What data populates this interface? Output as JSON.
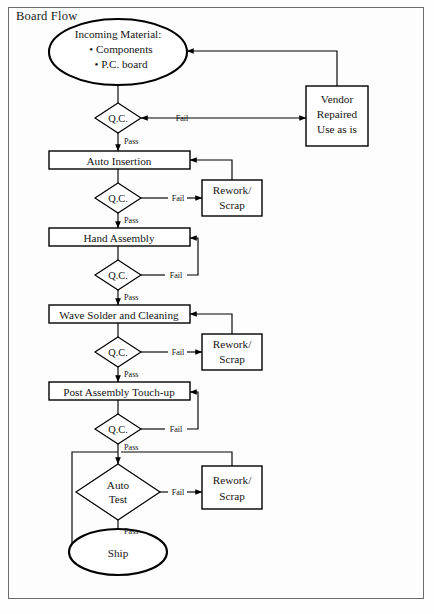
{
  "diagram": {
    "title": "Board Flow",
    "type": "flowchart",
    "nodes": [
      {
        "id": "incoming",
        "shape": "ellipse",
        "lines": [
          "Incoming Material:",
          "• Components",
          "• P.C. board"
        ]
      },
      {
        "id": "qc1",
        "shape": "diamond",
        "lines": [
          "Q.C."
        ]
      },
      {
        "id": "vendor",
        "shape": "box",
        "lines": [
          "Vendor",
          "Repaired",
          "Use as is"
        ]
      },
      {
        "id": "auto-insertion",
        "shape": "box",
        "lines": [
          "Auto Insertion"
        ]
      },
      {
        "id": "qc2",
        "shape": "diamond",
        "lines": [
          "Q.C."
        ]
      },
      {
        "id": "rework1",
        "shape": "box",
        "lines": [
          "Rework/",
          "Scrap"
        ]
      },
      {
        "id": "hand-assembly",
        "shape": "box",
        "lines": [
          "Hand Assembly"
        ]
      },
      {
        "id": "qc3",
        "shape": "diamond",
        "lines": [
          "Q.C."
        ]
      },
      {
        "id": "wave-solder",
        "shape": "box",
        "lines": [
          "Wave Solder and Cleaning"
        ]
      },
      {
        "id": "qc4",
        "shape": "diamond",
        "lines": [
          "Q.C."
        ]
      },
      {
        "id": "rework2",
        "shape": "box",
        "lines": [
          "Rework/",
          "Scrap"
        ]
      },
      {
        "id": "post-assembly",
        "shape": "box",
        "lines": [
          "Post Assembly Touch-up"
        ]
      },
      {
        "id": "qc5",
        "shape": "diamond",
        "lines": [
          "Q.C."
        ]
      },
      {
        "id": "auto-test",
        "shape": "diamond",
        "lines": [
          "Auto",
          "Test"
        ]
      },
      {
        "id": "rework3",
        "shape": "box",
        "lines": [
          "Rework/",
          "Scrap"
        ]
      },
      {
        "id": "ship",
        "shape": "ellipse",
        "lines": [
          "Ship"
        ]
      }
    ],
    "edge_labels": {
      "pass": "Pass",
      "fail": "Fail"
    },
    "edges": [
      {
        "from": "incoming",
        "to": "qc1",
        "label": ""
      },
      {
        "from": "qc1",
        "to": "vendor",
        "label": "Fail"
      },
      {
        "from": "vendor",
        "to": "incoming",
        "label": ""
      },
      {
        "from": "qc1",
        "to": "auto-insertion",
        "label": "Pass"
      },
      {
        "from": "auto-insertion",
        "to": "qc2",
        "label": ""
      },
      {
        "from": "qc2",
        "to": "rework1",
        "label": "Fail"
      },
      {
        "from": "rework1",
        "to": "auto-insertion",
        "label": ""
      },
      {
        "from": "qc2",
        "to": "hand-assembly",
        "label": "Pass"
      },
      {
        "from": "hand-assembly",
        "to": "qc3",
        "label": ""
      },
      {
        "from": "qc3",
        "to": "hand-assembly",
        "label": "Fail"
      },
      {
        "from": "qc3",
        "to": "wave-solder",
        "label": "Pass"
      },
      {
        "from": "wave-solder",
        "to": "qc4",
        "label": ""
      },
      {
        "from": "qc4",
        "to": "rework2",
        "label": "Fail"
      },
      {
        "from": "rework2",
        "to": "wave-solder",
        "label": ""
      },
      {
        "from": "qc4",
        "to": "post-assembly",
        "label": "Pass"
      },
      {
        "from": "post-assembly",
        "to": "qc5",
        "label": ""
      },
      {
        "from": "qc5",
        "to": "post-assembly",
        "label": "Fail"
      },
      {
        "from": "qc5",
        "to": "auto-test",
        "label": "Pass"
      },
      {
        "from": "qc5",
        "to": "ship",
        "label": ""
      },
      {
        "from": "auto-test",
        "to": "rework3",
        "label": "Fail"
      },
      {
        "from": "rework3",
        "to": "auto-test",
        "label": ""
      },
      {
        "from": "auto-test",
        "to": "ship",
        "label": "Pass"
      }
    ],
    "colors": {
      "stroke": "#000000",
      "fill": "#ffffff",
      "frame": "#6c6c6c",
      "text": "#141414"
    }
  }
}
